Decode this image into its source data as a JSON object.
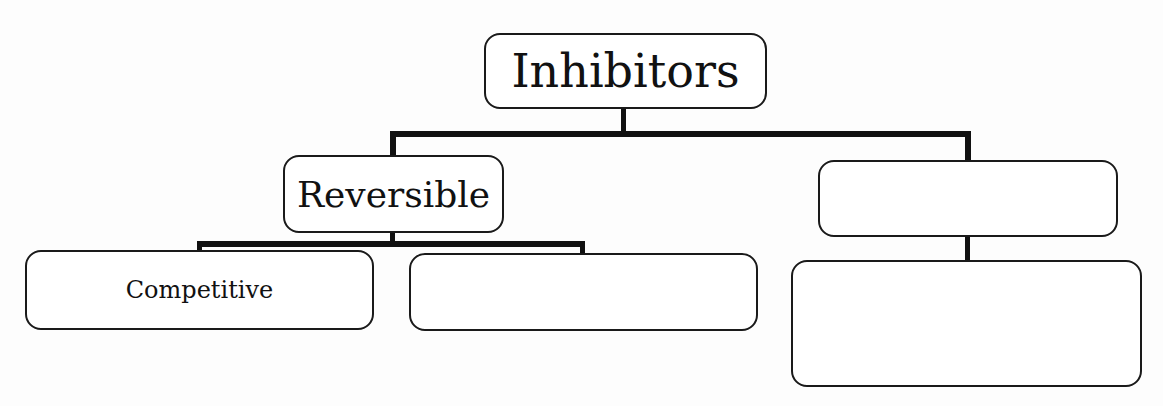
{
  "diagram": {
    "type": "tree",
    "title": "Inhibitors",
    "root": {
      "label": "Inhibitors",
      "children": [
        {
          "label": "Reversible",
          "children": [
            {
              "label": "Competitive"
            },
            {
              "label": ""
            }
          ]
        },
        {
          "label": "",
          "children": [
            {
              "label": ""
            }
          ]
        }
      ]
    },
    "colors": {
      "background": "#fdfdfd",
      "box_fill": "#ffffff",
      "box_border": "#1a1a1a",
      "connector": "#111111",
      "text": "#111111"
    }
  }
}
